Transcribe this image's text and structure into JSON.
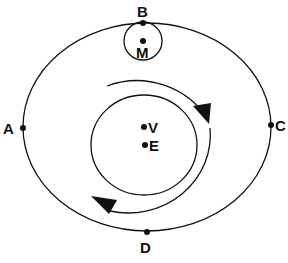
{
  "diagram": {
    "type": "orbital-diagram",
    "colors": {
      "stroke": "#111111",
      "background": "#ffffff"
    },
    "labels": {
      "A": "A",
      "B": "B",
      "C": "C",
      "D": "D",
      "M": "M",
      "V": "V",
      "E": "E"
    },
    "elements": {
      "outer_orbit": {
        "shape": "ellipse",
        "points_on": [
          "A",
          "B",
          "C",
          "D"
        ]
      },
      "moon_circle": {
        "shape": "circle",
        "center": "M",
        "tangent_at": "B"
      },
      "inner_orbit": {
        "shape": "circle",
        "contains": [
          "V",
          "E"
        ]
      },
      "rotation_arrows": {
        "direction": "clockwise",
        "count": 2
      }
    }
  }
}
